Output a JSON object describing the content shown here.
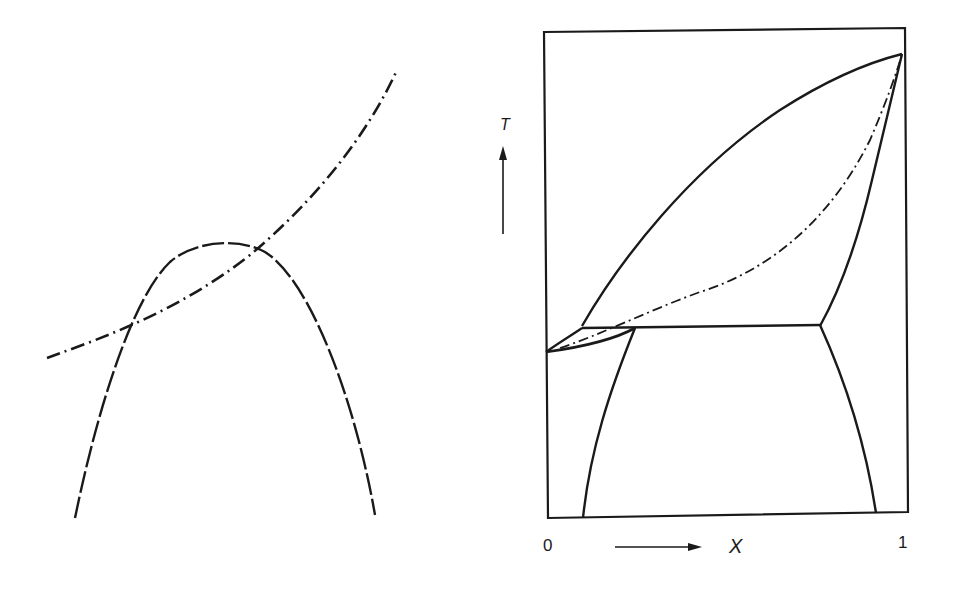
{
  "figure": {
    "left_panel": {
      "description": "Free-energy style curves: dashed inverted parabola and dash-dot rising curve crossing it",
      "curves": [
        {
          "name": "dashed-parabola",
          "style": "dashed"
        },
        {
          "name": "dash-dot-curve",
          "style": "dash-dot"
        }
      ]
    },
    "right_panel": {
      "description": "Binary phase diagram with T vs X axes",
      "y_axis_label": "T",
      "x_axis_label": "X",
      "x_tick_min": "0",
      "x_tick_max": "1",
      "curves": [
        {
          "name": "liquidus-upper",
          "style": "solid"
        },
        {
          "name": "metastable-dash-dot",
          "style": "dash-dot"
        },
        {
          "name": "right-solidus",
          "style": "solid"
        },
        {
          "name": "eutectic-horizontal",
          "style": "solid"
        },
        {
          "name": "left-lens",
          "style": "solid"
        },
        {
          "name": "left-solvus",
          "style": "solid"
        },
        {
          "name": "right-solvus",
          "style": "solid"
        }
      ]
    },
    "colors": {
      "ink": "#1a1a1a",
      "background": "#ffffff"
    }
  }
}
